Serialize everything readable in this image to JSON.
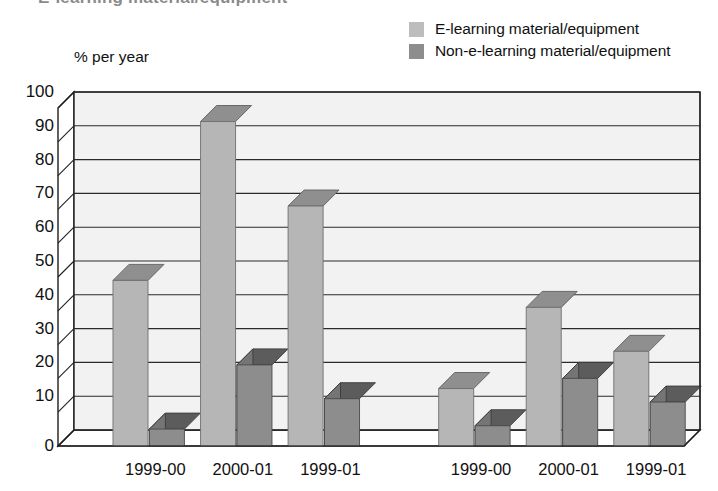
{
  "title_sliver": "E-learning material/equipment",
  "axis_title": "% per year",
  "legend": {
    "position": "top-right",
    "items": [
      {
        "label": "E-learning material/equipment",
        "color": "#bdbdbd",
        "swatch": "legend-swatch-light"
      },
      {
        "label": "Non-e-learning material/equipment",
        "color": "#8d8d8d",
        "swatch": "legend-swatch-dark"
      }
    ]
  },
  "chart_data": {
    "type": "bar",
    "title": "",
    "subtitle": "",
    "xlabel": "",
    "ylabel": "% per year",
    "ylim": [
      0,
      100
    ],
    "ytick_step": 10,
    "yticks": [
      100,
      90,
      80,
      70,
      60,
      50,
      40,
      30,
      20,
      10,
      0
    ],
    "ytick_labels": [
      "100",
      "90",
      "80",
      "70",
      "60",
      "50",
      "40",
      "30",
      "20",
      "10",
      "0"
    ],
    "grid": true,
    "grid_axis": "y",
    "style": "3d-column",
    "legend_position": "top-right",
    "categories": [
      "1999-00",
      "2000-01",
      "1999-01",
      "1999-00",
      "2000-01",
      "1999-01"
    ],
    "group_gap_after_index": 2,
    "series": [
      {
        "name": "E-learning material/equipment",
        "color": "#b6b6b6",
        "values": [
          49,
          96,
          71,
          17,
          41,
          28
        ]
      },
      {
        "name": "Non-e-learning material/equipment",
        "color": "#8d8d8d",
        "values": [
          5,
          24,
          14,
          6,
          20,
          13
        ]
      }
    ]
  }
}
